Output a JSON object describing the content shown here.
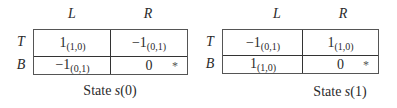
{
  "games": [
    {
      "caption_prefix": "State ",
      "caption_var": "s",
      "caption_arg": "(0)",
      "columns": [
        "L",
        "R"
      ],
      "rows": [
        "T",
        "B"
      ],
      "cells": [
        [
          {
            "value": "1",
            "sub": "(1,0)",
            "star": ""
          },
          {
            "value": "−1",
            "sub": "(0,1)",
            "star": ""
          }
        ],
        [
          {
            "value": "−1",
            "sub": "(0,1)",
            "star": ""
          },
          {
            "value": "0",
            "sub": "",
            "star": "*"
          }
        ]
      ]
    },
    {
      "caption_prefix": "State ",
      "caption_var": "s",
      "caption_arg": "(1)",
      "columns": [
        "L",
        "R"
      ],
      "rows": [
        "T",
        "B"
      ],
      "cells": [
        [
          {
            "value": "−1",
            "sub": "(0,1)",
            "star": ""
          },
          {
            "value": "1",
            "sub": "(1,0)",
            "star": ""
          }
        ],
        [
          {
            "value": "1",
            "sub": "(1,0)",
            "star": ""
          },
          {
            "value": "0",
            "sub": "",
            "star": "*"
          }
        ]
      ]
    }
  ]
}
